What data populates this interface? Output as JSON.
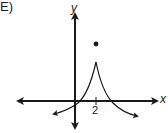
{
  "choice_label": "E)",
  "axes": {
    "x_label": "x",
    "y_label": "y",
    "ticks": [
      {
        "axis": "x",
        "value": 2,
        "label": "2"
      }
    ]
  },
  "graph": {
    "description": "Curve with a cusp at x = 2 rising toward a point above it; left branch increases from lower-left through origin region, right branch decreases and crosses x-axis, ending below x-axis with arrows.",
    "special_point": {
      "x": 2,
      "marker": "closed-dot",
      "position": "above cusp"
    },
    "color": "#1a1a1a"
  }
}
